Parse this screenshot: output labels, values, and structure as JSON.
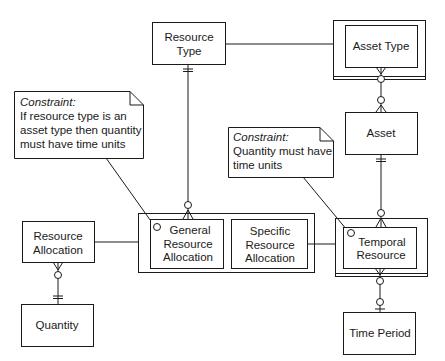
{
  "diagram": {
    "type": "entity-relationship",
    "entities": {
      "resource_type": {
        "label_lines": [
          "Resource",
          "Type"
        ]
      },
      "asset_type": {
        "label_lines": [
          "Asset Type"
        ],
        "style": "supertype-with-subtypes"
      },
      "asset": {
        "label_lines": [
          "Asset"
        ]
      },
      "resource_allocation": {
        "label_lines": [
          "Resource",
          "Allocation"
        ]
      },
      "quantity": {
        "label_lines": [
          "Quantity"
        ]
      },
      "general_resource_allocation": {
        "label_lines": [
          "General",
          "Resource",
          "Allocation"
        ]
      },
      "specific_resource_allocation": {
        "label_lines": [
          "Specific",
          "Resource",
          "Allocation"
        ]
      },
      "temporal_resource": {
        "label_lines": [
          "Temporal",
          "Resource"
        ]
      },
      "time_period": {
        "label_lines": [
          "Time Period"
        ]
      }
    },
    "notes": {
      "constraint1": {
        "title": "Constraint:",
        "lines": [
          "If resource type is an",
          "asset type then quantity",
          "must have time units"
        ]
      },
      "constraint2": {
        "title": "Constraint:",
        "lines": [
          "Quantity must have",
          "time units"
        ]
      }
    },
    "relationships": [
      {
        "from": "Resource Type",
        "to": "General Resource Allocation",
        "from_card": "one-and-only-one",
        "to_card": "zero-or-many"
      },
      {
        "from": "Resource Type",
        "to": "Asset Type",
        "type": "subtype"
      },
      {
        "from": "Asset Type",
        "to": "Asset",
        "from_card": "zero-or-many",
        "to_card": "zero-or-many"
      },
      {
        "from": "Asset",
        "to": "Temporal Resource",
        "from_card": "one-and-only-one",
        "to_card": "zero-or-many"
      },
      {
        "from": "Resource Allocation",
        "to": "Quantity",
        "from_card": "zero-or-many",
        "to_card": "one-and-only-one"
      },
      {
        "from": "Resource Allocation",
        "to": "General/Specific Resource Allocation",
        "type": "subtype"
      },
      {
        "from": "Specific Resource Allocation",
        "to": "Temporal Resource",
        "type": "link"
      },
      {
        "from": "Temporal Resource",
        "to": "Time Period",
        "from_card": "zero-or-many",
        "to_card": "zero-or-one"
      }
    ],
    "colors": {
      "line": "#1a1a1a",
      "background": "#ffffff"
    }
  }
}
